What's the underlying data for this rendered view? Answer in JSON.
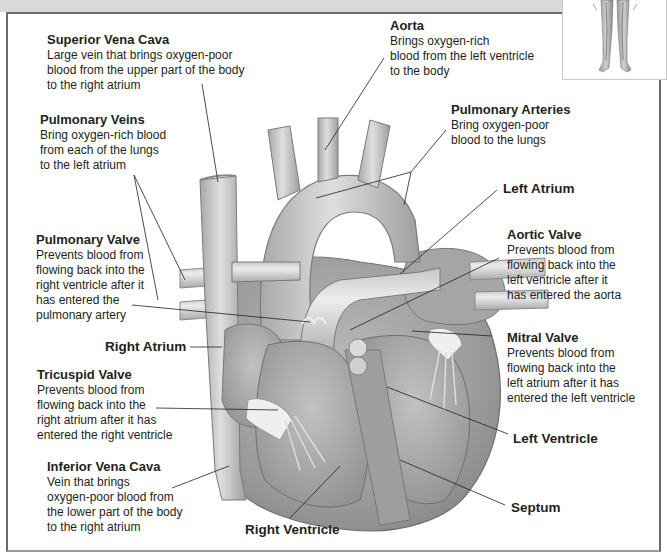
{
  "diagram": {
    "inset_caption": "",
    "labels": {
      "superior_vena_cava": {
        "title": "Superior Vena Cava",
        "lines": [
          "Large vein that brings oxygen-poor",
          "blood from the upper part of the body",
          "to the right atrium"
        ]
      },
      "pulmonary_veins": {
        "title": "Pulmonary Veins",
        "lines": [
          "Bring oxygen-rich blood",
          "from each of the lungs",
          "to the left atrium"
        ]
      },
      "pulmonary_valve": {
        "title": "Pulmonary Valve",
        "lines": [
          "Prevents blood from",
          "flowing back into the",
          "right ventricle after it",
          "has entered the",
          "pulmonary artery"
        ]
      },
      "right_atrium": {
        "title": "Right Atrium"
      },
      "tricuspid_valve": {
        "title": "Tricuspid Valve",
        "lines": [
          "Prevents blood from",
          "flowing back into the",
          "right atrium after it has",
          "entered the right ventricle"
        ]
      },
      "inferior_vena_cava": {
        "title": "Inferior Vena Cava",
        "lines": [
          "Vein that brings",
          "oxygen-poor blood from",
          "the lower part of the body",
          "to the right atrium"
        ]
      },
      "right_ventricle": {
        "title": "Right Ventricle"
      },
      "aorta": {
        "title": "Aorta",
        "lines": [
          "Brings oxygen-rich",
          "blood from the left ventricle",
          "to the body"
        ]
      },
      "pulmonary_arteries": {
        "title": "Pulmonary Arteries",
        "lines": [
          "Bring oxygen-poor",
          "blood to the lungs"
        ]
      },
      "left_atrium": {
        "title": "Left Atrium"
      },
      "aortic_valve": {
        "title": "Aortic Valve",
        "lines": [
          "Prevents blood from",
          "flowing back into the",
          "left ventricle after it",
          "has entered the aorta"
        ]
      },
      "mitral_valve": {
        "title": "Mitral Valve",
        "lines": [
          "Prevents blood from",
          "flowing back into the",
          "left atrium after it has",
          "entered the left ventricle"
        ]
      },
      "left_ventricle": {
        "title": "Left Ventricle"
      },
      "septum": {
        "title": "Septum"
      }
    },
    "colors": {
      "frame": "#6b6b6b",
      "top_strip": "#d9d9d9",
      "vessel_light": "#d4d4d4",
      "vessel_mid": "#b5b5b5",
      "tissue_dark": "#8e8e8e",
      "leader_line": "#231f20"
    }
  }
}
